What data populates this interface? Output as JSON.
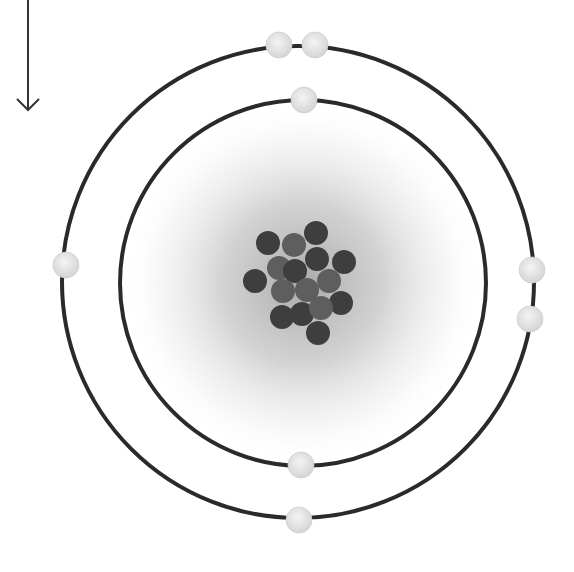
{
  "diagram": {
    "type": "bohr-atom-model",
    "arrow": {
      "direction": "down",
      "x": 28,
      "y1": 0,
      "y2": 110
    },
    "cloud": {
      "cx": 303,
      "cy": 283,
      "r": 180,
      "color": "#a8a8a8"
    },
    "orbits": [
      {
        "name": "inner-shell",
        "cx": 303,
        "cy": 283,
        "r": 183,
        "color": "#2a2a2a",
        "electron_count": 2
      },
      {
        "name": "outer-shell",
        "cx": 298,
        "cy": 282,
        "r": 236,
        "color": "#2a2a2a",
        "electron_count": 6
      }
    ],
    "electrons": [
      {
        "shell": 1,
        "x": 304,
        "y": 100
      },
      {
        "shell": 1,
        "x": 301,
        "y": 465
      },
      {
        "shell": 2,
        "x": 279,
        "y": 45
      },
      {
        "shell": 2,
        "x": 315,
        "y": 45
      },
      {
        "shell": 2,
        "x": 66,
        "y": 265
      },
      {
        "shell": 2,
        "x": 532,
        "y": 270
      },
      {
        "shell": 2,
        "x": 530,
        "y": 319
      },
      {
        "shell": 2,
        "x": 299,
        "y": 520
      }
    ],
    "electron_style": {
      "r": 13,
      "fill": "#e6e6e6"
    },
    "nucleus": {
      "particle_count": 16,
      "particle_r": 12,
      "particles": [
        {
          "x": 268,
          "y": 243,
          "kind": "dark"
        },
        {
          "x": 294,
          "y": 245,
          "kind": "light"
        },
        {
          "x": 316,
          "y": 233,
          "kind": "dark"
        },
        {
          "x": 279,
          "y": 268,
          "kind": "light"
        },
        {
          "x": 295,
          "y": 271,
          "kind": "dark"
        },
        {
          "x": 317,
          "y": 259,
          "kind": "dark"
        },
        {
          "x": 344,
          "y": 262,
          "kind": "dark"
        },
        {
          "x": 255,
          "y": 281,
          "kind": "dark"
        },
        {
          "x": 283,
          "y": 291,
          "kind": "light"
        },
        {
          "x": 307,
          "y": 290,
          "kind": "light"
        },
        {
          "x": 329,
          "y": 281,
          "kind": "light"
        },
        {
          "x": 341,
          "y": 303,
          "kind": "dark"
        },
        {
          "x": 282,
          "y": 317,
          "kind": "dark"
        },
        {
          "x": 302,
          "y": 314,
          "kind": "dark"
        },
        {
          "x": 321,
          "y": 308,
          "kind": "light"
        },
        {
          "x": 318,
          "y": 333,
          "kind": "dark"
        }
      ],
      "colors": {
        "dark": "#3e3e3e",
        "light": "#5e5e5e"
      }
    }
  }
}
